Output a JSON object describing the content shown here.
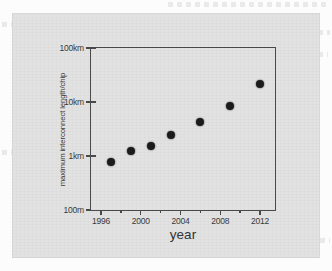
{
  "figure": {
    "panel_background": "#e2e2e2",
    "frame_color": "#4a4a4a",
    "marker_color": "#1b1b1b"
  },
  "chart_data": {
    "type": "scatter",
    "title": "",
    "xlabel": "year",
    "ylabel": "maximum interconnect length/chip",
    "xlim": [
      1995,
      2013.5
    ],
    "ylim_labels": [
      "100m",
      "1km",
      "10km",
      "100km"
    ],
    "ylim": [
      0.1,
      100
    ],
    "y_scale": "log",
    "y_unit": "km",
    "grid": false,
    "legend": null,
    "xticks": [
      1996,
      2000,
      2004,
      2008,
      2012
    ],
    "xtick_labels": [
      "1996",
      "2000",
      "2004",
      "2008",
      "2012"
    ],
    "yticks": [
      0.1,
      1,
      10,
      100
    ],
    "ytick_labels": [
      "100m",
      "1km",
      "10km",
      "100km"
    ],
    "x": [
      1997,
      1999,
      2001,
      2003,
      2006,
      2009,
      2012
    ],
    "values": [
      0.78,
      1.23,
      1.55,
      2.5,
      4.2,
      8.5,
      22
    ],
    "points": [
      {
        "x": 1997,
        "y": 0.78,
        "label": "0.78km"
      },
      {
        "x": 1999,
        "y": 1.23,
        "label": "1.23km"
      },
      {
        "x": 2001,
        "y": 1.55,
        "label": "1.55km"
      },
      {
        "x": 2003,
        "y": 2.5,
        "label": "2.5km"
      },
      {
        "x": 2006,
        "y": 4.2,
        "label": "4.2km"
      },
      {
        "x": 2009,
        "y": 8.5,
        "label": "8.5km"
      },
      {
        "x": 2012,
        "y": 22.0,
        "label": "22km"
      }
    ]
  },
  "ghost_text_rows": [
    {
      "left": 168,
      "top": 2,
      "width": 160
    },
    {
      "left": 2,
      "top": 22,
      "width": 26
    },
    {
      "left": 300,
      "top": 30,
      "width": 30
    },
    {
      "left": 300,
      "top": 52,
      "width": 28
    },
    {
      "left": 2,
      "top": 150,
      "width": 10
    },
    {
      "left": 302,
      "top": 238,
      "width": 28
    }
  ]
}
